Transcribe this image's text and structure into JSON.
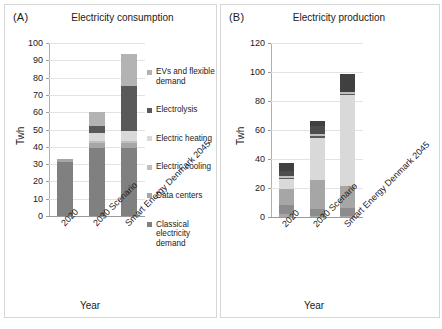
{
  "figure": {
    "panels": [
      {
        "tag": "(A)",
        "title": "Electricity consumption",
        "ylabel": "Twh",
        "xlabel": "Year"
      },
      {
        "tag": "(B)",
        "title": "Electricity production",
        "ylabel": "Twh",
        "xlabel": "Year"
      }
    ]
  },
  "chart_data": [
    {
      "type": "bar",
      "title": "Electricity consumption",
      "panel": "(A)",
      "xlabel": "Year",
      "ylabel": "Twh",
      "ylim": [
        0,
        100
      ],
      "yticks": [
        0,
        10,
        20,
        30,
        40,
        50,
        60,
        70,
        80,
        90,
        100
      ],
      "grid": true,
      "stacked": true,
      "legend_position": "right",
      "categories": [
        "2020",
        "2030 Scenario",
        "Smart Energy Denmark 2045"
      ],
      "series": [
        {
          "name": "Classical electricity demand",
          "color": "#808080",
          "values": [
            31.5,
            39.5,
            39.5
          ]
        },
        {
          "name": "Data centers",
          "color": "#a6a6a6",
          "values": [
            1.5,
            2.5,
            2.5
          ]
        },
        {
          "name": "Electric cooling",
          "color": "#bfbfbf",
          "values": [
            0,
            1.5,
            1.5
          ]
        },
        {
          "name": "Electric heating",
          "color": "#d9d9d9",
          "values": [
            0,
            4.5,
            5.5
          ]
        },
        {
          "name": "Electrolysis",
          "color": "#595959",
          "values": [
            0,
            4.0,
            26.0
          ]
        },
        {
          "name": "EVs and flexible demand",
          "color": "#b3b3b3",
          "values": [
            0,
            8.0,
            18.5
          ]
        }
      ],
      "totals": [
        33,
        60,
        93.5
      ]
    },
    {
      "type": "bar",
      "title": "Electricity production",
      "panel": "(B)",
      "xlabel": "Year",
      "ylabel": "Twh",
      "ylim": [
        0,
        120
      ],
      "yticks": [
        0,
        20,
        40,
        60,
        80,
        100,
        120
      ],
      "grid": true,
      "stacked": true,
      "legend_position": "right",
      "categories": [
        "2020",
        "2030 Scenario",
        "Smart Energy Denmark 2045"
      ],
      "series": [
        {
          "name": "Industrial CHP",
          "color": "#a6a6a6",
          "values": [
            2.0,
            1.0,
            0.5
          ]
        },
        {
          "name": "CHP",
          "color": "#8c8c8c",
          "values": [
            6.0,
            4.5,
            5.5
          ]
        },
        {
          "name": "Onshore wind",
          "color": "#a6a6a6",
          "values": [
            11.5,
            20.0,
            15.5
          ]
        },
        {
          "name": "Offshore wind",
          "color": "#d9d9d9",
          "values": [
            6.5,
            29.0,
            62.5
          ]
        },
        {
          "name": "Solar PV",
          "color": "#595959",
          "values": [
            1.0,
            1.5,
            1.0
          ]
        },
        {
          "name": "Other renewables",
          "color": "#bfbfbf",
          "values": [
            1.5,
            1.0,
            1.0
          ]
        },
        {
          "name": "Power plants",
          "color": "#4d4d4d",
          "values": [
            3.0,
            5.5,
            0.5
          ]
        },
        {
          "name": "Import",
          "color": "#404040",
          "values": [
            5.5,
            3.5,
            12.0
          ]
        }
      ],
      "totals": [
        37,
        66,
        98.5
      ]
    }
  ]
}
